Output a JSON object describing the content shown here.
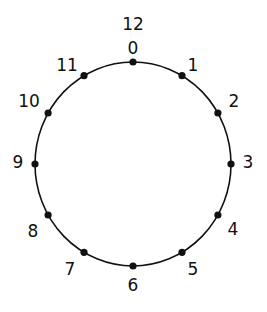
{
  "diagram": {
    "type": "clock-cycle",
    "center": [
      133,
      164
    ],
    "radius_x": 98,
    "radius_y": 102,
    "stroke_color": "#111111",
    "dot_color": "#111111",
    "top_extra_label": "12",
    "points": [
      {
        "label": "0",
        "lx": 133,
        "ly": 54
      },
      {
        "label": "1",
        "lx": 193,
        "ly": 71
      },
      {
        "label": "2",
        "lx": 234,
        "ly": 107
      },
      {
        "label": "3",
        "lx": 248,
        "ly": 168
      },
      {
        "label": "4",
        "lx": 233,
        "ly": 235
      },
      {
        "label": "5",
        "lx": 193,
        "ly": 275
      },
      {
        "label": "6",
        "lx": 133,
        "ly": 291
      },
      {
        "label": "7",
        "lx": 70,
        "ly": 275
      },
      {
        "label": "8",
        "lx": 33,
        "ly": 237
      },
      {
        "label": "9",
        "lx": 18,
        "ly": 168
      },
      {
        "label": "10",
        "lx": 29,
        "ly": 107
      },
      {
        "label": "11",
        "lx": 67,
        "ly": 71
      }
    ]
  }
}
